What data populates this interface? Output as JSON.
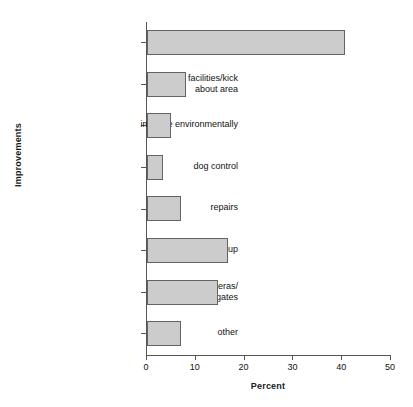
{
  "chart_data": {
    "type": "bar",
    "orientation": "horizontal",
    "title": "",
    "xlabel": "Percent",
    "ylabel": "Improvements",
    "categories": [
      "equip better",
      "new sport facilities/kick\nabout area",
      "improve environmentally",
      "dog control",
      "repairs",
      "clean it up",
      "make safer/cameras/\nsecurity staff/gates",
      "other"
    ],
    "values": [
      40.6,
      8.0,
      5.0,
      3.3,
      7.0,
      16.5,
      14.5,
      7.0
    ],
    "xlim": [
      0,
      50
    ],
    "xticks": [
      0,
      10,
      20,
      30,
      40,
      50
    ],
    "xtick_labels": [
      "0",
      "10",
      "20",
      "30",
      "40",
      "50"
    ],
    "grid": false,
    "legend": false,
    "bar_fill_color": "#cccccc",
    "bar_border_color": "#636363",
    "axis_color": "#555555",
    "background_color": "#ffffff"
  }
}
